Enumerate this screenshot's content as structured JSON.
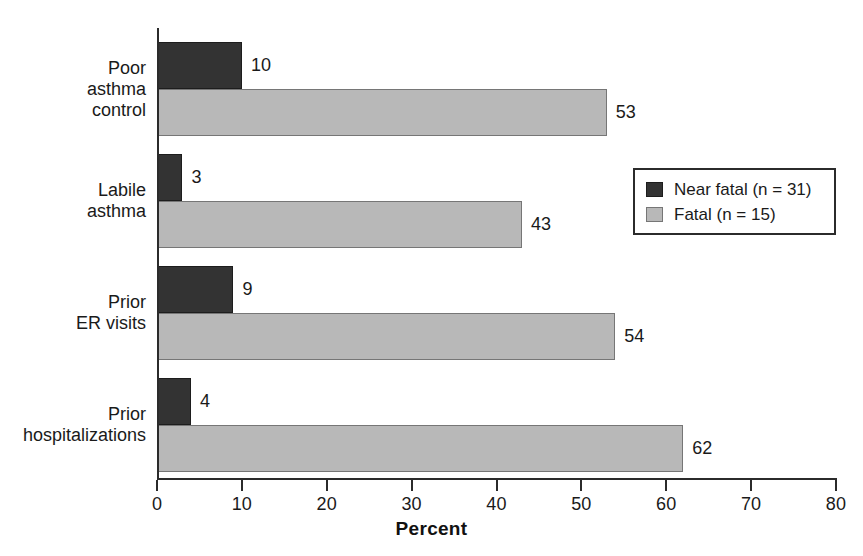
{
  "chart_data": {
    "type": "bar",
    "orientation": "horizontal",
    "title": "",
    "xlabel": "Percent",
    "ylabel": "",
    "xlim": [
      0,
      80
    ],
    "xticks": [
      0,
      10,
      20,
      30,
      40,
      50,
      60,
      70,
      80
    ],
    "grid": false,
    "legend_position": "right-middle",
    "categories": [
      "Poor asthma control",
      "Labile asthma",
      "Prior ER visits",
      "Prior hospitalizations"
    ],
    "series": [
      {
        "name": "Near fatal (n = 31)",
        "color": "#333333",
        "values": [
          10,
          3,
          9,
          4
        ]
      },
      {
        "name": "Fatal (n = 15)",
        "color": "#b8b8b8",
        "values": [
          53,
          43,
          54,
          62
        ]
      }
    ]
  },
  "axis": {
    "x_title": "Percent",
    "tick_labels": [
      "0",
      "10",
      "20",
      "30",
      "40",
      "50",
      "60",
      "70",
      "80"
    ]
  },
  "categories": [
    {
      "id": "poor-asthma-control",
      "lines": [
        "Poor",
        "asthma",
        "control"
      ]
    },
    {
      "id": "labile-asthma",
      "lines": [
        "Labile",
        "asthma"
      ]
    },
    {
      "id": "prior-er-visits",
      "lines": [
        "Prior",
        "ER visits"
      ]
    },
    {
      "id": "prior-hospitalizations",
      "lines": [
        "Prior",
        "hospitalizations"
      ]
    }
  ],
  "bars": [
    {
      "category": "poor-asthma-control",
      "series": "near-fatal",
      "value": 10,
      "label": "10"
    },
    {
      "category": "poor-asthma-control",
      "series": "fatal",
      "value": 53,
      "label": "53"
    },
    {
      "category": "labile-asthma",
      "series": "near-fatal",
      "value": 3,
      "label": "3"
    },
    {
      "category": "labile-asthma",
      "series": "fatal",
      "value": 43,
      "label": "43"
    },
    {
      "category": "prior-er-visits",
      "series": "near-fatal",
      "value": 9,
      "label": "9"
    },
    {
      "category": "prior-er-visits",
      "series": "fatal",
      "value": 54,
      "label": "54"
    },
    {
      "category": "prior-hospitalizations",
      "series": "near-fatal",
      "value": 4,
      "label": "4"
    },
    {
      "category": "prior-hospitalizations",
      "series": "fatal",
      "value": 62,
      "label": "62"
    }
  ],
  "legend": {
    "entries": [
      {
        "id": "near-fatal",
        "label": "Near fatal (n = 31)",
        "color": "#333333"
      },
      {
        "id": "fatal",
        "label": "Fatal (n = 15)",
        "color": "#b8b8b8"
      }
    ]
  },
  "colors": {
    "near_fatal": "#333333",
    "fatal": "#b8b8b8",
    "axis": "#2b2b2b",
    "text": "#1a1a1a",
    "background": "#ffffff"
  },
  "caption": ""
}
